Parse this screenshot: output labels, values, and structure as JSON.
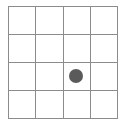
{
  "board": {
    "rows": 4,
    "cols": 4,
    "line_color": "#8c8c8c",
    "background": "#ffffff",
    "pieces": [
      {
        "row": 2,
        "col": 2,
        "color": "#5a5a5a"
      }
    ]
  }
}
